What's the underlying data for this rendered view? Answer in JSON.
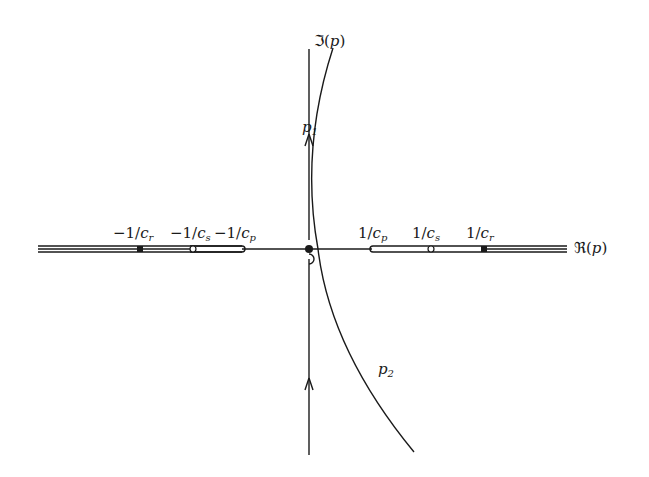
{
  "diagram": {
    "type": "complex-plane contour diagram",
    "colors": {
      "stroke": "#1a1a1a",
      "background": "#ffffff"
    },
    "axes": {
      "imag_label": {
        "prefix": "ℑ(",
        "var": "p",
        "suffix": ")"
      },
      "real_label": {
        "prefix": "ℜ(",
        "var": "p",
        "suffix": ")"
      }
    },
    "branch_points": {
      "left": [
        {
          "num": "−1/",
          "var": "c",
          "sub": "r",
          "marker": "filled-square"
        },
        {
          "num": "−1/",
          "var": "c",
          "sub": "s",
          "marker": "open-circle"
        },
        {
          "num": "−1/",
          "var": "c",
          "sub": "p",
          "marker": "slit-end"
        }
      ],
      "right": [
        {
          "num": "1/",
          "var": "c",
          "sub": "p",
          "marker": "slit-end"
        },
        {
          "num": "1/",
          "var": "c",
          "sub": "s",
          "marker": "open-circle"
        },
        {
          "num": "1/",
          "var": "c",
          "sub": "r",
          "marker": "filled-square"
        }
      ]
    },
    "contour_labels": {
      "p1": {
        "var": "p",
        "sub": "1"
      },
      "p2": {
        "var": "p",
        "sub": "2"
      }
    }
  }
}
